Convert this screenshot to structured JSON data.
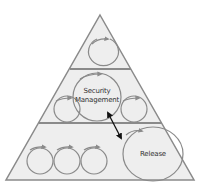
{
  "diagram": {
    "type": "pyramid",
    "layers": [
      {
        "id": "top",
        "cycles": 1
      },
      {
        "id": "middle",
        "cycles": 3,
        "highlight_label": "Security\nManagement"
      },
      {
        "id": "bottom",
        "cycles": 4,
        "highlight_label": "Release"
      }
    ],
    "labels": {
      "security_line1": "Security",
      "security_line2": "Management",
      "release": "Release"
    },
    "connector": {
      "type": "double-arrow",
      "from": "Security Management",
      "to": "Release"
    },
    "colors": {
      "fill": "#eeeeee",
      "stroke": "#8a8a8a",
      "arrow": "#111111",
      "text": "#333333"
    }
  }
}
